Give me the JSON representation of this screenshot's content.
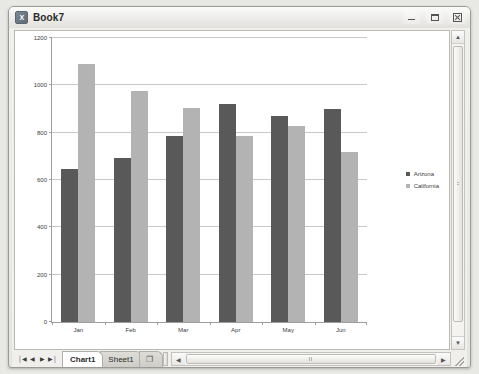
{
  "window": {
    "title": "Book7",
    "icon": "excel-icon",
    "icon_text": "X",
    "controls": {
      "minimize_label": "Minimize",
      "maximize_label": "Maximize",
      "close_label": "Close"
    }
  },
  "chart_data": {
    "type": "bar",
    "title": "",
    "xlabel": "",
    "ylabel": "",
    "categories": [
      "Jan",
      "Feb",
      "Mar",
      "Apr",
      "May",
      "Jun"
    ],
    "series": [
      {
        "name": "Arizona",
        "color": "#595959",
        "values": [
          645,
          692,
          786,
          920,
          870,
          898
        ]
      },
      {
        "name": "California",
        "color": "#b3b3b3",
        "values": [
          1090,
          975,
          905,
          785,
          828,
          720
        ]
      }
    ],
    "ylim": [
      0,
      1200
    ],
    "yticks": [
      0,
      200,
      400,
      600,
      800,
      1000,
      1200
    ],
    "ytick_labels": [
      "0",
      "200",
      "400",
      "600",
      "800",
      "1000",
      "1200"
    ],
    "grid": true,
    "legend_position": "right"
  },
  "tabs": {
    "nav": {
      "first_label": "│◀",
      "prev_label": "◀",
      "next_label": "▶",
      "last_label": "▶│"
    },
    "sheets": [
      {
        "label": "Chart1",
        "active": true
      },
      {
        "label": "Sheet1",
        "active": false
      }
    ],
    "new_sheet_label": "❐"
  },
  "scrollbars": {
    "vertical": {
      "up_label": "▲",
      "down_label": "▼"
    },
    "horizontal": {
      "left_label": "◀",
      "right_label": "▶"
    }
  }
}
